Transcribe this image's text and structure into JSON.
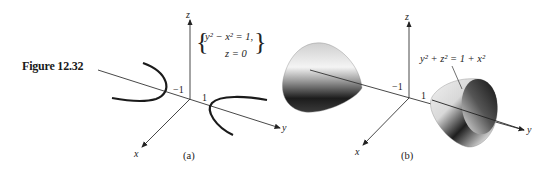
{
  "figure": {
    "label": "Figure 12.32"
  },
  "panel_a": {
    "caption": "(a)",
    "equation_line1": "y² − x² = 1,",
    "equation_line2": "z = 0",
    "axis_labels": {
      "x": "x",
      "y": "y",
      "z": "z"
    },
    "tick_labels": {
      "neg_one": "−1",
      "one": "1"
    },
    "curve_color": "#1a1a1a"
  },
  "panel_b": {
    "caption": "(b)",
    "equation": "y² + z² = 1 + x²",
    "axis_labels": {
      "x": "x",
      "y": "y",
      "z": "z"
    },
    "tick_labels": {
      "neg_one": "−1",
      "one": "1"
    }
  },
  "colors": {
    "axis": "#333333",
    "text": "#222222",
    "surface_light": "#f2f2f2",
    "surface_dark": "#1e1e1e"
  }
}
